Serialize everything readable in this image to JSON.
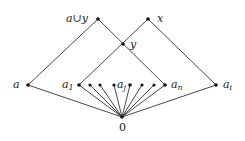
{
  "diagram": {
    "type": "hasse-diagram",
    "nodes": {
      "a_union_y": {
        "label": "a∪y",
        "x": 98,
        "y": 19
      },
      "x": {
        "label": "x",
        "x": 148,
        "y": 19
      },
      "y": {
        "label": "y",
        "x": 123,
        "y": 44
      },
      "a": {
        "label": "a",
        "x": 28,
        "y": 85
      },
      "a1": {
        "label": "a",
        "sub": "1",
        "x": 79,
        "y": 85
      },
      "a_j": {
        "label": "a",
        "sub": "j",
        "x": 130,
        "y": 85
      },
      "a_n": {
        "label": "a",
        "sub": "n",
        "x": 165,
        "y": 85
      },
      "a_i": {
        "label": "a",
        "sub": "i",
        "x": 216,
        "y": 85
      },
      "zero": {
        "label": "0",
        "x": 122,
        "y": 117
      }
    },
    "extra_atoms_x": [
      90,
      100,
      114,
      142,
      154
    ],
    "edges": [
      [
        "a_union_y",
        "a"
      ],
      [
        "a_union_y",
        "a_n"
      ],
      [
        "x",
        "a1"
      ],
      [
        "x",
        "a_i"
      ],
      [
        "a",
        "zero"
      ],
      [
        "a_i",
        "zero"
      ],
      [
        "a1",
        "zero"
      ],
      [
        "a_n",
        "zero"
      ],
      [
        "a_j",
        "zero"
      ]
    ]
  }
}
